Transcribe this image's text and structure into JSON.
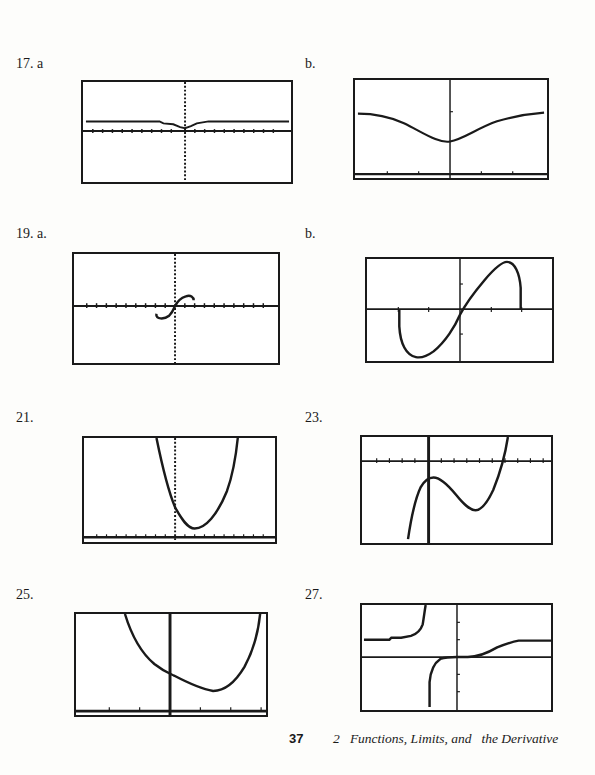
{
  "problems": [
    {
      "id": "17a",
      "label": "17. a",
      "description": "graph of a function with shallow dip at origin, horizontal asymptote slightly above x-axis"
    },
    {
      "id": "17b",
      "label": "b.",
      "description": "zoomed view: V-shaped valley with minimum on y-axis, leveling off at both ends"
    },
    {
      "id": "19a",
      "label": "19. a.",
      "description": "small S-shaped curve through the origin"
    },
    {
      "id": "19b",
      "label": "b.",
      "description": "zoomed view: S-curve with minimum in lower left and maximum in upper right, vertical endpoints"
    },
    {
      "id": "21",
      "label": "21.",
      "description": "upward parabola with vertex right of the y-axis near the bottom"
    },
    {
      "id": "23",
      "label": "23.",
      "description": "cubic with local max at y-axis and local min to the right"
    },
    {
      "id": "25",
      "label": "25.",
      "description": "convex curve decreasing then sharply increasing, minimum right of y-axis"
    },
    {
      "id": "27",
      "label": "27.",
      "description": "rational function with vertical asymptote left of y-axis and horizontal asymptote above x-axis"
    }
  ],
  "footer": {
    "page_number": "37",
    "chapter": "2   Functions, Limits, and   the Derivative"
  }
}
